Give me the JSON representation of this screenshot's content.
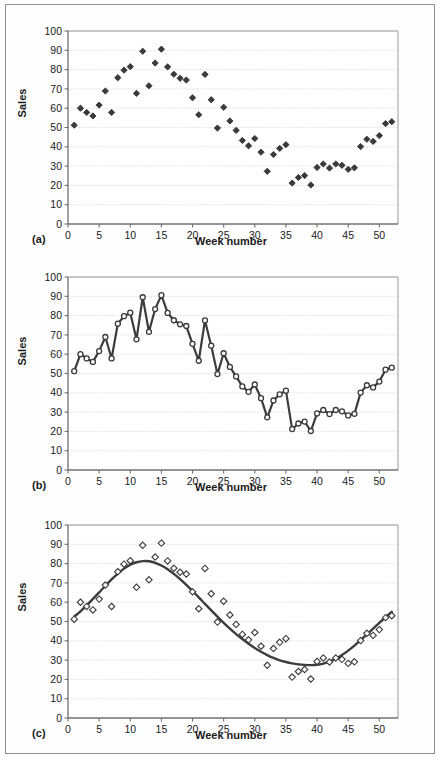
{
  "figure": {
    "panel_labels": {
      "a": "(a)",
      "b": "(b)",
      "c": "(c)"
    },
    "axis_titles": {
      "y": "Sales",
      "x": "Week number"
    },
    "colors": {
      "frame": "#8e9094",
      "axis": "#6e7074",
      "gridline": "#c9c9c9",
      "marker_fill": "#3a3a3a",
      "marker_open_stroke": "#3a3a3a",
      "series_line": "#3c3c3c",
      "fit_curve": "#3c3c3c",
      "text": "#1b1b1b",
      "background": "#ffffff"
    }
  },
  "chart_data": [
    {
      "type": "scatter",
      "panel": "(a)",
      "title": "",
      "xlabel": "Week number",
      "ylabel": "Sales",
      "xlim": [
        0,
        53
      ],
      "ylim": [
        0,
        100
      ],
      "xticks": [
        0,
        5,
        10,
        15,
        20,
        25,
        30,
        35,
        40,
        45,
        50
      ],
      "yticks": [
        0,
        10,
        20,
        30,
        40,
        50,
        60,
        70,
        80,
        90,
        100
      ],
      "grid": true,
      "legend": "none",
      "marker": "filled-diamond",
      "x": [
        1,
        2,
        3,
        4,
        5,
        6,
        7,
        8,
        9,
        10,
        11,
        12,
        13,
        14,
        15,
        16,
        17,
        18,
        19,
        20,
        21,
        22,
        23,
        24,
        25,
        26,
        27,
        28,
        29,
        30,
        31,
        32,
        33,
        34,
        35,
        36,
        37,
        38,
        39,
        40,
        41,
        42,
        43,
        44,
        45,
        46,
        47,
        48,
        49,
        50,
        51,
        52
      ],
      "values": [
        51.2,
        60.0,
        57.8,
        56.0,
        61.6,
        68.9,
        57.8,
        75.8,
        79.7,
        81.5,
        67.7,
        89.5,
        71.6,
        83.4,
        90.6,
        81.4,
        77.6,
        75.5,
        74.6,
        65.4,
        56.6,
        77.5,
        64.4,
        49.7,
        60.5,
        53.4,
        48.5,
        43.3,
        40.5,
        44.3,
        37.2,
        27.3,
        36.0,
        39.2,
        41.1,
        21.2,
        24.1,
        25.1,
        20.2,
        29.3,
        31.1,
        29.0,
        31.1,
        30.4,
        28.3,
        29.1,
        40.1,
        43.9,
        42.8,
        45.8,
        52.0,
        53.0
      ]
    },
    {
      "type": "line",
      "panel": "(b)",
      "title": "",
      "xlabel": "Week number",
      "ylabel": "Sales",
      "xlim": [
        0,
        53
      ],
      "ylim": [
        0,
        100
      ],
      "xticks": [
        0,
        5,
        10,
        15,
        20,
        25,
        30,
        35,
        40,
        45,
        50
      ],
      "yticks": [
        0,
        10,
        20,
        30,
        40,
        50,
        60,
        70,
        80,
        90,
        100
      ],
      "grid": true,
      "legend": "none",
      "marker": "open-circle",
      "x": [
        1,
        2,
        3,
        4,
        5,
        6,
        7,
        8,
        9,
        10,
        11,
        12,
        13,
        14,
        15,
        16,
        17,
        18,
        19,
        20,
        21,
        22,
        23,
        24,
        25,
        26,
        27,
        28,
        29,
        30,
        31,
        32,
        33,
        34,
        35,
        36,
        37,
        38,
        39,
        40,
        41,
        42,
        43,
        44,
        45,
        46,
        47,
        48,
        49,
        50,
        51,
        52
      ],
      "values": [
        51.2,
        60.0,
        57.8,
        56.0,
        61.6,
        68.9,
        57.8,
        75.8,
        79.7,
        81.5,
        67.7,
        89.5,
        71.6,
        83.4,
        90.6,
        81.4,
        77.6,
        75.5,
        74.6,
        65.4,
        56.6,
        77.5,
        64.4,
        49.7,
        60.5,
        53.4,
        48.5,
        43.3,
        40.5,
        44.3,
        37.2,
        27.3,
        36.0,
        39.2,
        41.1,
        21.2,
        24.1,
        25.1,
        20.2,
        29.3,
        31.1,
        29.0,
        31.1,
        30.4,
        28.3,
        29.1,
        40.1,
        43.9,
        42.8,
        45.8,
        52.0,
        53.0
      ]
    },
    {
      "type": "scatter",
      "panel": "(c)",
      "title": "",
      "xlabel": "Week number",
      "ylabel": "Sales",
      "xlim": [
        0,
        53
      ],
      "ylim": [
        0,
        100
      ],
      "xticks": [
        0,
        5,
        10,
        15,
        20,
        25,
        30,
        35,
        40,
        45,
        50
      ],
      "yticks": [
        0,
        10,
        20,
        30,
        40,
        50,
        60,
        70,
        80,
        90,
        100
      ],
      "grid": true,
      "legend": "none",
      "marker": "open-diamond",
      "x": [
        1,
        2,
        3,
        4,
        5,
        6,
        7,
        8,
        9,
        10,
        11,
        12,
        13,
        14,
        15,
        16,
        17,
        18,
        19,
        20,
        21,
        22,
        23,
        24,
        25,
        26,
        27,
        28,
        29,
        30,
        31,
        32,
        33,
        34,
        35,
        36,
        37,
        38,
        39,
        40,
        41,
        42,
        43,
        44,
        45,
        46,
        47,
        48,
        49,
        50,
        51,
        52
      ],
      "values": [
        51.2,
        60.0,
        57.8,
        56.0,
        61.6,
        68.9,
        57.8,
        75.8,
        79.7,
        81.5,
        67.7,
        89.5,
        71.6,
        83.4,
        90.6,
        81.4,
        77.6,
        75.5,
        74.6,
        65.4,
        56.6,
        77.5,
        64.4,
        49.7,
        60.5,
        53.4,
        48.5,
        43.3,
        40.5,
        44.3,
        37.2,
        27.3,
        36.0,
        39.2,
        41.1,
        21.2,
        24.1,
        25.1,
        20.2,
        29.3,
        31.1,
        29.0,
        31.1,
        30.4,
        28.3,
        29.1,
        40.1,
        43.9,
        42.8,
        45.8,
        52.0,
        53.0
      ],
      "fit_curve": {
        "name": "seasonal trend fit",
        "x": [
          1,
          2,
          3,
          4,
          5,
          6,
          7,
          8,
          9,
          10,
          11,
          12,
          13,
          14,
          15,
          16,
          17,
          18,
          19,
          20,
          21,
          22,
          23,
          24,
          25,
          26,
          27,
          28,
          29,
          30,
          31,
          32,
          33,
          34,
          35,
          36,
          37,
          38,
          39,
          40,
          41,
          42,
          43,
          44,
          45,
          46,
          47,
          48,
          49,
          50,
          51,
          52
        ],
        "values": [
          52.5,
          55.3,
          58.4,
          61.7,
          65.1,
          68.5,
          71.8,
          74.8,
          77.4,
          79.4,
          80.7,
          81.3,
          81.2,
          80.4,
          79.0,
          77.1,
          74.7,
          72.0,
          69.0,
          65.8,
          62.5,
          59.1,
          55.8,
          52.5,
          49.3,
          46.3,
          43.5,
          40.9,
          38.5,
          36.3,
          34.3,
          32.6,
          31.1,
          29.9,
          29.0,
          28.3,
          27.8,
          27.5,
          27.4,
          27.6,
          28.2,
          29.2,
          30.7,
          32.6,
          34.9,
          37.5,
          40.3,
          43.3,
          46.3,
          49.3,
          52.2,
          55.0
        ]
      }
    }
  ]
}
